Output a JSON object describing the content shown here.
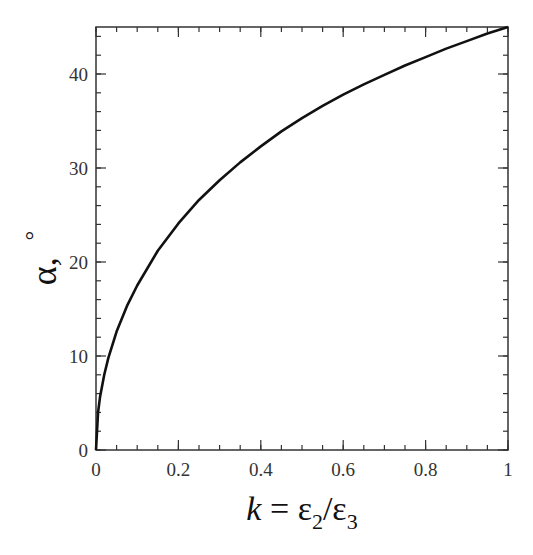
{
  "chart_data": {
    "type": "line",
    "title": "",
    "xlabel": "k = ε2/ε3",
    "xlabel_parts": {
      "k": "k",
      "eq": " = ",
      "e1": "ε",
      "sub1": "2",
      "slash": "/",
      "e2": "ε",
      "sub2": "3"
    },
    "ylabel": "α, °",
    "ylabel_parts": {
      "alpha": "α,",
      "degree": "°"
    },
    "xlim": [
      0,
      1
    ],
    "ylim": [
      0,
      45
    ],
    "x_ticks": [
      0,
      0.2,
      0.4,
      0.6,
      0.8,
      1
    ],
    "x_tick_labels": [
      "0",
      "0.2",
      "0.4",
      "0.6",
      "0.8",
      "1"
    ],
    "y_ticks": [
      0,
      10,
      20,
      30,
      40
    ],
    "y_tick_labels": [
      "0",
      "10",
      "20",
      "30",
      "40"
    ],
    "x_minor_step": 0.05,
    "y_minor_step": 2,
    "grid": false,
    "legend": null,
    "series": [
      {
        "name": "α(k)",
        "color": "#111111",
        "x": [
          0,
          0.005,
          0.01,
          0.02,
          0.03,
          0.05,
          0.075,
          0.1,
          0.15,
          0.2,
          0.25,
          0.3,
          0.35,
          0.4,
          0.45,
          0.5,
          0.55,
          0.6,
          0.65,
          0.7,
          0.75,
          0.8,
          0.85,
          0.9,
          0.95,
          1.0
        ],
        "y": [
          0,
          4.0,
          5.7,
          8.0,
          9.8,
          12.6,
          15.3,
          17.5,
          21.2,
          24.1,
          26.6,
          28.7,
          30.6,
          32.3,
          33.9,
          35.3,
          36.6,
          37.8,
          38.9,
          39.9,
          40.9,
          41.8,
          42.7,
          43.5,
          44.3,
          45.0
        ]
      }
    ]
  }
}
